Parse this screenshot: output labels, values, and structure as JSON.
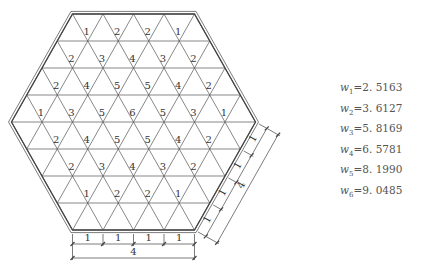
{
  "diagram": {
    "type": "hexagonal triangular grid with node values",
    "hexagon_side_units": 4,
    "node_rows": [
      [
        1,
        2,
        2,
        1
      ],
      [
        2,
        3,
        4,
        3,
        2
      ],
      [
        2,
        4,
        5,
        5,
        4,
        2
      ],
      [
        1,
        3,
        5,
        6,
        5,
        3,
        1
      ],
      [
        2,
        4,
        5,
        5,
        4,
        2
      ],
      [
        2,
        3,
        4,
        3,
        2
      ],
      [
        1,
        2,
        2,
        1
      ]
    ],
    "bottom_dimension": {
      "segments": [
        "1",
        "1",
        "1",
        "1"
      ],
      "total": "4"
    },
    "side_dimension": {
      "segments": [
        "1",
        "1",
        "1",
        "1"
      ],
      "total": "4"
    },
    "colors": {
      "line": "#444444",
      "text": "#333333"
    }
  },
  "legend": {
    "values": [
      {
        "symbol": "w",
        "sub": "1",
        "value": "2. 5163"
      },
      {
        "symbol": "w",
        "sub": "2",
        "value": "3. 6127"
      },
      {
        "symbol": "w",
        "sub": "3",
        "value": "5. 8169"
      },
      {
        "symbol": "w",
        "sub": "4",
        "value": "6. 5781"
      },
      {
        "symbol": "w",
        "sub": "5",
        "value": "8. 1990"
      },
      {
        "symbol": "w",
        "sub": "6",
        "value": "9. 0485"
      }
    ]
  }
}
